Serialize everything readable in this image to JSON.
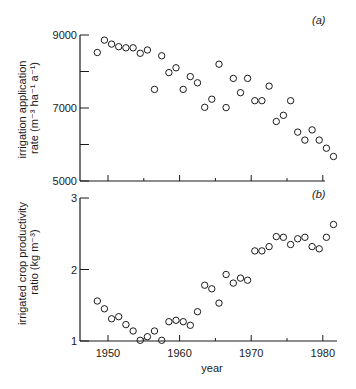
{
  "chart_data": [
    {
      "type": "scatter",
      "panel_label": "(a)",
      "title": "",
      "xlabel": "",
      "ylabel_line1": "irrigation application",
      "ylabel_line2": "rate (m⁻³ ha⁻¹ a⁻¹)",
      "ylim": [
        5000,
        9000
      ],
      "xlim": [
        1946,
        1982
      ],
      "y_ticks_major": [
        5000,
        7000,
        9000
      ],
      "y_tick_labels": [
        "5000",
        "7000",
        "9000"
      ],
      "y_ticks_minor": [
        6000,
        8000
      ],
      "x_ticks_major": [
        1950,
        1960,
        1970,
        1980
      ],
      "x_ticks_minor": [
        1955,
        1965,
        1975
      ],
      "grid": false,
      "marker": "open-circle",
      "x": [
        1948,
        1949,
        1950,
        1951,
        1952,
        1953,
        1954,
        1955,
        1956,
        1957,
        1958,
        1959,
        1960,
        1961,
        1962,
        1963,
        1964,
        1965,
        1966,
        1967,
        1968,
        1969,
        1970,
        1971,
        1972,
        1973,
        1974,
        1975,
        1976,
        1977,
        1978,
        1979,
        1980,
        1981
      ],
      "values": [
        8520,
        8860,
        8750,
        8680,
        8650,
        8650,
        8500,
        8590,
        7510,
        8430,
        7970,
        8100,
        7510,
        7860,
        7690,
        7020,
        7240,
        8200,
        7010,
        7810,
        7420,
        7810,
        7200,
        7200,
        7600,
        6630,
        6800,
        7200,
        6340,
        6120,
        6400,
        6120,
        5900,
        5670
      ]
    },
    {
      "type": "scatter",
      "panel_label": "(b)",
      "title": "",
      "xlabel": "year",
      "ylabel_line1": "irrigated crop productivity",
      "ylabel_line2": "ratio (kg m⁻³)",
      "ylim": [
        1,
        3
      ],
      "xlim": [
        1946,
        1982
      ],
      "y_ticks_major": [
        1,
        2,
        3
      ],
      "y_tick_labels": [
        "1",
        "2",
        "3"
      ],
      "y_ticks_minor": [],
      "x_ticks_major": [
        1950,
        1960,
        1970,
        1980
      ],
      "x_tick_labels": [
        "1950",
        "1960",
        "1970",
        "1980"
      ],
      "x_ticks_minor": [
        1955,
        1965,
        1975
      ],
      "grid": false,
      "marker": "open-circle",
      "x": [
        1948,
        1949,
        1950,
        1951,
        1952,
        1953,
        1954,
        1955,
        1956,
        1957,
        1958,
        1959,
        1960,
        1961,
        1962,
        1963,
        1964,
        1965,
        1966,
        1967,
        1968,
        1969,
        1970,
        1971,
        1972,
        1973,
        1974,
        1975,
        1976,
        1977,
        1978,
        1979,
        1980,
        1981
      ],
      "values": [
        1.56,
        1.45,
        1.31,
        1.34,
        1.23,
        1.14,
        1.01,
        1.06,
        1.14,
        1.01,
        1.27,
        1.29,
        1.27,
        1.22,
        1.41,
        1.78,
        1.73,
        1.53,
        1.93,
        1.81,
        1.88,
        1.85,
        2.26,
        2.26,
        2.32,
        2.46,
        2.45,
        2.35,
        2.43,
        2.45,
        2.32,
        2.29,
        2.45,
        2.63
      ]
    }
  ],
  "colors": {
    "ink": "#1a1a1a",
    "background": "#ffffff"
  }
}
